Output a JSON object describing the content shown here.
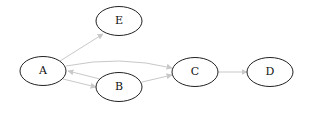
{
  "diagram": {
    "type": "directed-graph",
    "edge_color": "#c8c8c8",
    "node_stroke": "#222222",
    "node_fill": "#ffffff",
    "nodes": [
      {
        "id": "A",
        "label": "A",
        "cx": 43,
        "cy": 71
      },
      {
        "id": "E",
        "label": "E",
        "cx": 119,
        "cy": 21
      },
      {
        "id": "B",
        "label": "B",
        "cx": 119,
        "cy": 87
      },
      {
        "id": "C",
        "label": "C",
        "cx": 195,
        "cy": 72
      },
      {
        "id": "D",
        "label": "D",
        "cx": 270,
        "cy": 72
      }
    ],
    "edges": [
      {
        "from": "A",
        "to": "E"
      },
      {
        "from": "A",
        "to": "C"
      },
      {
        "from": "A",
        "to": "B"
      },
      {
        "from": "B",
        "to": "A"
      },
      {
        "from": "B",
        "to": "C"
      },
      {
        "from": "C",
        "to": "D"
      }
    ]
  }
}
